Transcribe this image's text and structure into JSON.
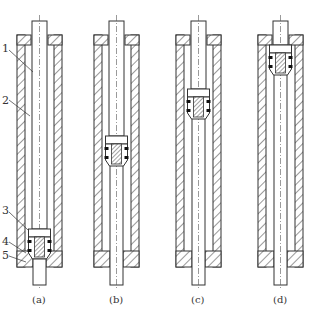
{
  "diagram": {
    "callouts": [
      {
        "id": "1",
        "label": "1"
      },
      {
        "id": "2",
        "label": "2"
      },
      {
        "id": "3",
        "label": "3"
      },
      {
        "id": "4",
        "label": "4"
      },
      {
        "id": "5",
        "label": "5"
      }
    ],
    "panels": [
      {
        "id": "a",
        "caption": "(a)"
      },
      {
        "id": "b",
        "caption": "(b)"
      },
      {
        "id": "c",
        "caption": "(c)"
      },
      {
        "id": "d",
        "caption": "(d)"
      }
    ],
    "colors": {
      "line": "#333333",
      "background": "#ffffff",
      "seal": "#111111"
    }
  }
}
